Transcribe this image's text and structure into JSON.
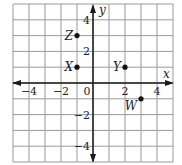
{
  "diagram": {
    "type": "coordinate-plane",
    "axes": {
      "x_label": "x",
      "y_label": "y",
      "x_range": [
        -5,
        5
      ],
      "y_range": [
        -5,
        5
      ],
      "x_ticks": [
        {
          "value": -4,
          "label": "−4"
        },
        {
          "value": -2,
          "label": "−2"
        },
        {
          "value": 0,
          "label": "0"
        },
        {
          "value": 2,
          "label": "2"
        },
        {
          "value": 4,
          "label": "4"
        }
      ],
      "y_ticks": [
        {
          "value": 4,
          "label": "4"
        },
        {
          "value": 2,
          "label": "2"
        },
        {
          "value": -2,
          "label": "−2"
        },
        {
          "value": -4,
          "label": "−4"
        }
      ]
    },
    "points": [
      {
        "name": "Z",
        "x": -1,
        "y": 3
      },
      {
        "name": "X",
        "x": -1,
        "y": 1
      },
      {
        "name": "Y",
        "x": 2,
        "y": 1
      },
      {
        "name": "W",
        "x": 3,
        "y": -1
      }
    ],
    "colors": {
      "grid": "#9a9a9a",
      "axis": "#1a1a1a",
      "point": "#111111"
    }
  }
}
